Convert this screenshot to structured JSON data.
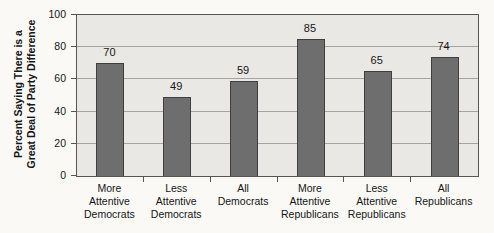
{
  "chart_data": {
    "type": "bar",
    "title": "",
    "xlabel": "",
    "ylabel": "Percent Saying There is a Great Deal of Party Difference",
    "ylabel_lines": [
      "Percent Saying There is a",
      "Great Deal of Party Difference"
    ],
    "categories": [
      "More Attentive Democrats",
      "Less Attentive Democrats",
      "All Democrats",
      "More Attentive Republicans",
      "Less Attentive Republicans",
      "All Republicans"
    ],
    "values": [
      70,
      49,
      59,
      85,
      65,
      74
    ],
    "ylim": [
      0,
      100
    ],
    "yticks": [
      0,
      20,
      40,
      60,
      80,
      100
    ],
    "grid": "horizontal",
    "legend": "none"
  },
  "colors": {
    "page_bg": "#faf9f6",
    "plot_bg": "#e9e8e5",
    "bar_fill": "#6e6e6e",
    "bar_border": "#3f3f3f",
    "grid": "#a3a3a1",
    "frame": "#565656",
    "text": "#161616"
  }
}
